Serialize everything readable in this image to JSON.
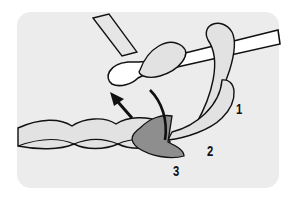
{
  "diagram": {
    "labels": [
      {
        "id": "1",
        "text": "1"
      },
      {
        "id": "2",
        "text": "2"
      },
      {
        "id": "3",
        "text": "3"
      }
    ],
    "colors": {
      "background": "#ececec",
      "yarn": "#e2e2e2",
      "highlight": "#8e8e8e",
      "hook": "#ffffff",
      "outline": "#111111"
    }
  }
}
